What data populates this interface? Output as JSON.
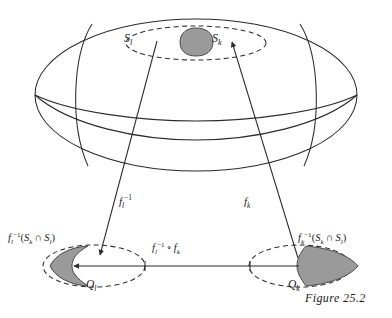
{
  "figure": {
    "caption": "Figure 25.2",
    "domain": "differential-geometry-manifold-chart-transition",
    "colors": {
      "stroke": "#2b2b2b",
      "shaded_fill": "#9a9a9a",
      "shaded_stroke": "#4a4a4a",
      "background": "#ffffff",
      "text": "#1a1a1a"
    }
  },
  "manifold": {
    "name": "sphere-ellipsoid",
    "patches": [
      {
        "id": "S_l",
        "label_html": "S<sub>l</sub>",
        "label_text": "S_l"
      },
      {
        "id": "S_k",
        "label_html": "S<sub>k</sub>",
        "label_text": "S_k"
      }
    ],
    "intersection_blob": "S_k ∩ S_l"
  },
  "maps": {
    "left_arrow_label_html": "f<sub>l</sub><sup>&#8722;1</sup>",
    "left_arrow_label_text": "f_l^{-1}",
    "right_arrow_label_html": "f<sub>k</sub>",
    "right_arrow_label_text": "f_k",
    "transition_label_html": "f<sub>l</sub><sup>&#8722;1</sup> ∘ f<sub>k</sub>",
    "transition_label_text": "f_l^{-1} o f_k"
  },
  "charts": {
    "left": {
      "domain_label_html": "Q<sub>l</sub>",
      "domain_label_text": "Q_l",
      "preimage_label_html": "f<sub>l</sub><sup>&#8722;1</sup>(S<sub>k</sub> ∩ S<sub>l</sub>)",
      "preimage_label_text": "f_l^{-1}(S_k ∩ S_l)"
    },
    "right": {
      "domain_label_html": "Q<sub>k</sub>",
      "domain_label_text": "Q_k",
      "preimage_label_html": "f<sub>k</sub><sup>&#8722;1</sup>(S<sub>k</sub> ∩ S<sub>l</sub>)",
      "preimage_label_text": "f_k^{-1}(S_k ∩ S_l)"
    }
  }
}
